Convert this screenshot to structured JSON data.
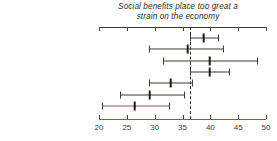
{
  "chart_data": {
    "type": "scatter",
    "subtype": "dot-and-whisker (point estimate with confidence interval)",
    "title": "Social benefits place too great a strain on the economy",
    "title_line1": "Social benefits place too great a",
    "title_line2": "strain on the economy",
    "xlabel": "",
    "ylabel": "",
    "xlim": [
      20,
      50
    ],
    "xticks": [
      20,
      25,
      30,
      35,
      40,
      45,
      50
    ],
    "xtick_labels": [
      "20",
      "25",
      "30",
      "35",
      "40",
      "45",
      "50"
    ],
    "grid": false,
    "legend": "none",
    "reference_line": {
      "orientation": "vertical",
      "value": 36.4,
      "style": "dashed",
      "color": "#2a2a2a"
    },
    "categories": [
      "Engineering",
      "Medicine",
      "Law",
      "Business & economics",
      "Maths & sciences",
      "Social & psych. sciences",
      "Humanities"
    ],
    "values": [
      38.8,
      36.0,
      40.0,
      40.0,
      33.0,
      29.2,
      26.5
    ],
    "ci_low": [
      36.4,
      29.0,
      31.5,
      36.3,
      29.0,
      23.7,
      20.6
    ],
    "ci_high": [
      41.4,
      42.2,
      48.4,
      43.3,
      36.7,
      35.3,
      32.5
    ],
    "series": [
      {
        "name": "Percent agreeing",
        "points": [
          {
            "category": "Engineering",
            "value": 38.8,
            "ci_low": 36.4,
            "ci_high": 41.4
          },
          {
            "category": "Medicine",
            "value": 36.0,
            "ci_low": 29.0,
            "ci_high": 42.2
          },
          {
            "category": "Law",
            "value": 40.0,
            "ci_low": 31.5,
            "ci_high": 48.4
          },
          {
            "category": "Business & economics",
            "value": 40.0,
            "ci_low": 36.3,
            "ci_high": 43.3
          },
          {
            "category": "Maths & sciences",
            "value": 33.0,
            "ci_low": 29.0,
            "ci_high": 36.7
          },
          {
            "category": "Social & psych. sciences",
            "value": 29.2,
            "ci_low": 23.7,
            "ci_high": 35.3
          },
          {
            "category": "Humanities",
            "value": 26.5,
            "ci_low": 20.6,
            "ci_high": 32.5
          }
        ]
      }
    ],
    "colors": {
      "point": "#1d1d1a",
      "whisker": "#3c3b34",
      "axis": "#3a3a33",
      "reference_line": "#2a2a2a",
      "text": "#33332c",
      "background": "#ffffff"
    }
  }
}
